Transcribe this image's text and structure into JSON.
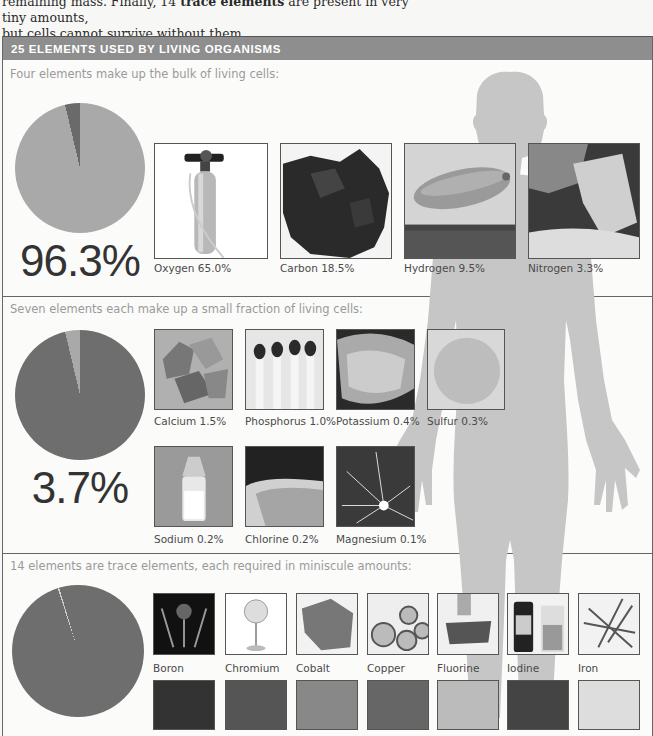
{
  "intro": {
    "line1_prefix": "remaining mass. Finally, 14 ",
    "line1_bold": "trace elements",
    "line1_suffix": " are present in very tiny amounts,",
    "line2": "but cells cannot survive without them."
  },
  "panel": {
    "title": "25 ELEMENTS USED BY LIVING ORGANISMS",
    "colors": {
      "header_bg": "#8e8e8e",
      "silhouette": "#c4c4c4"
    }
  },
  "sections": [
    {
      "subtitle": "Four elements make up the bulk of living cells:",
      "percent": "96.3%",
      "pie": {
        "main_color": "#a9a9a9",
        "slice_color": "#6a6a6a",
        "slice_percent": 3.7
      },
      "elements": [
        {
          "name": "Oxygen",
          "value": "65.0%",
          "label": "Oxygen 65.0%",
          "image": "oxygen-tank"
        },
        {
          "name": "Carbon",
          "value": "18.5%",
          "label": "Carbon 18.5%",
          "image": "coal-lump"
        },
        {
          "name": "Hydrogen",
          "value": "9.5%",
          "label": "Hydrogen 9.5%",
          "image": "airship"
        },
        {
          "name": "Nitrogen",
          "value": "3.3%",
          "label": "Nitrogen 3.3%",
          "image": "fertilizer-bag"
        }
      ]
    },
    {
      "subtitle": "Seven elements each make up a small fraction of living cells:",
      "percent": "3.7%",
      "pie": {
        "main_color": "#6e6e6e",
        "slice_color": "#a9a9a9",
        "slice_percent": 3.7
      },
      "elements": [
        {
          "name": "Calcium",
          "value": "1.5%",
          "label": "Calcium 1.5%",
          "image": "calcium-rocks"
        },
        {
          "name": "Phosphorus",
          "value": "1.0%",
          "label": "Phosphorus 1.0%",
          "image": "matches"
        },
        {
          "name": "Potassium",
          "value": "0.4%",
          "label": "Potassium 0.4%",
          "image": "potash-in-hand"
        },
        {
          "name": "Sulfur",
          "value": "0.3%",
          "label": "Sulfur 0.3%",
          "image": "sulfur-powder"
        },
        {
          "name": "Sodium",
          "value": "0.2%",
          "label": "Sodium 0.2%",
          "image": "salt-shaker"
        },
        {
          "name": "Chlorine",
          "value": "0.2%",
          "label": "Chlorine 0.2%",
          "image": "swimming-pool"
        },
        {
          "name": "Magnesium",
          "value": "0.1%",
          "label": "Magnesium 0.1%",
          "image": "sparkler"
        }
      ]
    },
    {
      "subtitle": "14 elements are trace elements, each required in miniscule amounts:",
      "pie": {
        "main_color": "#6e6e6e",
        "slice_color": "#cfcfcf",
        "slice_percent": 0.01
      },
      "elements": [
        {
          "name": "Boron",
          "label": "Boron",
          "image": "boron-apparatus"
        },
        {
          "name": "Chromium",
          "label": "Chromium",
          "image": "mirror"
        },
        {
          "name": "Cobalt",
          "label": "Cobalt",
          "image": "cobalt-ore"
        },
        {
          "name": "Copper",
          "label": "Copper",
          "image": "copper-pipes"
        },
        {
          "name": "Fluorine",
          "label": "Fluorine",
          "image": "toothbrush"
        },
        {
          "name": "Iodine",
          "label": "Iodine",
          "image": "iodine-bottle"
        },
        {
          "name": "Iron",
          "label": "Iron",
          "image": "nails"
        }
      ],
      "elements_row2_partial": [
        "slate",
        "metal-shavings",
        "pellets",
        "metal-sheets",
        "tin-can",
        "crystal",
        "batteries"
      ]
    }
  ]
}
